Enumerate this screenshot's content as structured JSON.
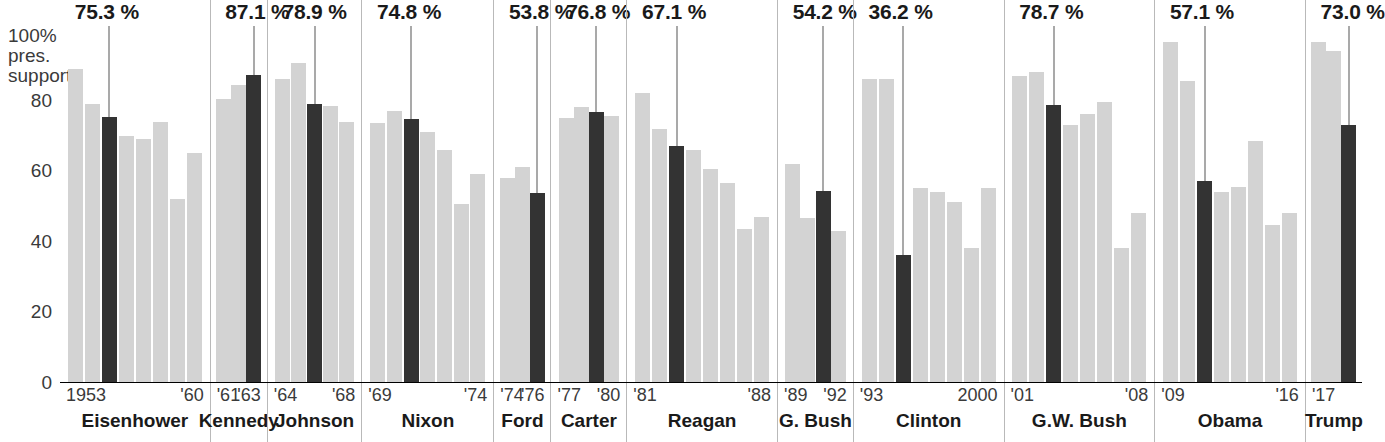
{
  "chart_data": {
    "type": "bar",
    "ylabel": "100% pres. support",
    "xlabel": "",
    "ylim": [
      0,
      100
    ],
    "yticks": [
      "100%",
      "80",
      "60",
      "40",
      "20",
      "0"
    ],
    "grid": false,
    "legend": "none",
    "colors": {
      "bar": "#d3d3d3",
      "highlight": "#333333",
      "divider": "#b9b9b9",
      "axis": "#000000"
    },
    "note": "Dark bar in each presidency is the highlighted first-year / callout value.",
    "series": [
      {
        "name": "Eisenhower",
        "callout": "75.3 %",
        "callout_value": 75.3,
        "year_left": "1953",
        "year_right": "'60",
        "highlight_index": 2,
        "values": [
          89.0,
          79.0,
          75.3,
          70.0,
          69.0,
          74.0,
          52.0,
          65.0
        ]
      },
      {
        "name": "Kennedy",
        "callout": "87.1 %",
        "callout_value": 87.1,
        "year_left": "'61",
        "year_right": "'63",
        "highlight_index": 2,
        "values": [
          80.5,
          84.5,
          87.1
        ]
      },
      {
        "name": "Johnson",
        "callout": "78.9 %",
        "callout_value": 78.9,
        "year_left": "'64",
        "year_right": "'68",
        "highlight_index": 2,
        "values": [
          86.0,
          90.5,
          78.9,
          78.5,
          74.0
        ]
      },
      {
        "name": "Nixon",
        "callout": "74.8 %",
        "callout_value": 74.8,
        "year_left": "'69",
        "year_right": "'74",
        "highlight_index": 2,
        "values": [
          73.5,
          77.0,
          74.8,
          71.0,
          66.0,
          50.5,
          59.0
        ]
      },
      {
        "name": "Ford",
        "callout": "53.8 %",
        "callout_value": 53.8,
        "year_left": "'74",
        "year_right": "'76",
        "highlight_index": 2,
        "values": [
          58.0,
          61.0,
          53.8
        ]
      },
      {
        "name": "Carter",
        "callout": "76.8 %",
        "callout_value": 76.8,
        "year_left": "'77",
        "year_right": "'80",
        "highlight_index": 2,
        "values": [
          75.0,
          78.0,
          76.8,
          75.5
        ]
      },
      {
        "name": "Reagan",
        "callout": "67.1 %",
        "callout_value": 67.1,
        "year_left": "'81",
        "year_right": "'88",
        "highlight_index": 2,
        "values": [
          82.0,
          72.0,
          67.1,
          66.0,
          60.5,
          56.5,
          43.5,
          47.0
        ]
      },
      {
        "name": "G. Bush",
        "callout": "54.2 %",
        "callout_value": 54.2,
        "year_left": "'89",
        "year_right": "'92",
        "highlight_index": 2,
        "values": [
          62.0,
          46.5,
          54.2,
          43.0
        ]
      },
      {
        "name": "Clinton",
        "callout": "36.2 %",
        "callout_value": 36.2,
        "year_left": "'93",
        "year_right": "2000",
        "highlight_index": 2,
        "values": [
          86.0,
          86.0,
          36.2,
          55.0,
          54.0,
          51.0,
          38.0,
          55.0
        ]
      },
      {
        "name": "G.W. Bush",
        "callout": "78.7 %",
        "callout_value": 78.7,
        "year_left": "'01",
        "year_right": "'08",
        "highlight_index": 2,
        "values": [
          87.0,
          88.0,
          78.7,
          73.0,
          76.0,
          79.5,
          38.0,
          48.0
        ]
      },
      {
        "name": "Obama",
        "callout": "57.1 %",
        "callout_value": 57.1,
        "year_left": "'09",
        "year_right": "'16",
        "highlight_index": 2,
        "values": [
          96.5,
          85.5,
          57.1,
          54.0,
          55.5,
          68.5,
          44.5,
          48.0
        ]
      },
      {
        "name": "Trump",
        "callout": "73.0 %",
        "callout_value": 73.0,
        "year_left": "'17",
        "year_right": "",
        "highlight_index": 2,
        "values": [
          96.5,
          94.0,
          73.0
        ]
      }
    ]
  },
  "axis": {
    "top_label_line1": "100%",
    "top_label_line2": "pres.",
    "top_label_line3": "support",
    "t80": "80",
    "t60": "60",
    "t40": "40",
    "t20": "20",
    "t0": "0"
  }
}
